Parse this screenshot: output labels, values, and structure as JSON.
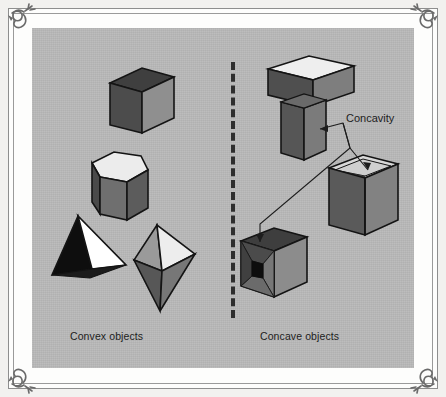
{
  "figure": {
    "background_color": "#b9b9b9",
    "frame_color": "#8e8e8e",
    "page_color": "#fdfdfc"
  },
  "labels": {
    "convex": "Convex objects",
    "concave": "Concave objects",
    "concavity": "Concavity"
  },
  "divider": {
    "style": "dashed",
    "orientation": "vertical",
    "color": "#2e2e2e"
  },
  "palette": {
    "face_dark": "#4a4a4a",
    "face_mid": "#6e6e6e",
    "face_light": "#9b9b9b",
    "face_top": "#e9e9e9",
    "face_white": "#ffffff",
    "face_black": "#111111",
    "outline": "#1a1a1a"
  },
  "objects": {
    "convex": [
      {
        "name": "cube",
        "label": "Cube"
      },
      {
        "name": "hexagonal-prism",
        "label": "Hexagonal prism"
      },
      {
        "name": "tetrahedron",
        "label": "Tetrahedron"
      },
      {
        "name": "bipyramid",
        "label": "Bipyramid"
      }
    ],
    "concave": [
      {
        "name": "t-shaped-block",
        "label": "T-shaped block"
      },
      {
        "name": "open-box",
        "label": "Open box"
      },
      {
        "name": "dimpled-cube",
        "label": "Dimpled cube"
      }
    ]
  },
  "annotations": {
    "concavity_targets": [
      "t-shaped-block-notch",
      "open-box-opening",
      "dimpled-cube-cavity"
    ]
  },
  "icons": {
    "corner_ornament": "flourish-ornament-icon"
  }
}
